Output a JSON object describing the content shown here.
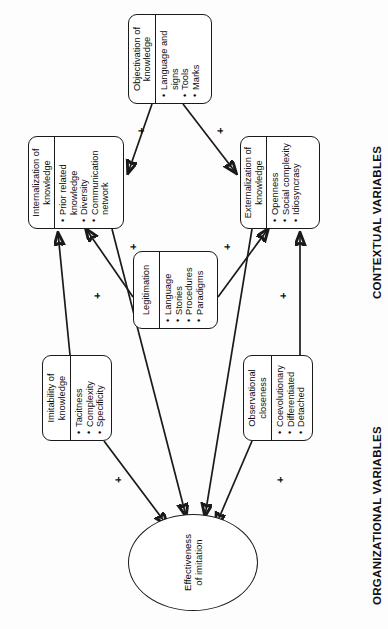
{
  "diagram": {
    "title_sections": {
      "contextual": "CONTEXTUAL VARIABLES",
      "organizational": "ORGANIZATIONAL VARIABLES"
    },
    "outcome": {
      "label": "Effectiveness\nof imitation",
      "line1": "Effectiveness",
      "line2": "of imitation"
    },
    "boxes": [
      {
        "id": "observational-closeness",
        "title": "Observational closeness",
        "items": [
          "Coevolutionary",
          "Differentiated",
          "Detached"
        ]
      },
      {
        "id": "imitability-of-knowledge",
        "title": "Imitability of knowledge",
        "items": [
          "Tacitness",
          "Complexity",
          "Specificity"
        ]
      },
      {
        "id": "legitimation",
        "title": "Legitimation",
        "items": [
          "Language",
          "Stories",
          "Procedures",
          "Paradigms"
        ]
      },
      {
        "id": "externalization-of-knowledge",
        "title": "Externalization of knowledge",
        "items": [
          "Openness",
          "Social complexity",
          "Idiosyncrasy"
        ]
      },
      {
        "id": "internalization-of-knowledge",
        "title": "Internalization of knowledge",
        "items": [
          "Prior related knowledge",
          "Diversity",
          "Communication network"
        ]
      },
      {
        "id": "objectivation-of-knowledge",
        "title": "Objectivation of knowledge",
        "items": [
          "Language and signs",
          "Tools",
          "Marks"
        ]
      }
    ],
    "signs": [
      {
        "id": "sign-observational-to-effectiveness",
        "value": "+"
      },
      {
        "id": "sign-imitability-to-effectiveness",
        "value": "+"
      },
      {
        "id": "sign-observational-to-externalization",
        "value": "+"
      },
      {
        "id": "sign-imitability-to-internalization",
        "value": "+"
      },
      {
        "id": "sign-legitimation-to-externalization",
        "value": "+"
      },
      {
        "id": "sign-legitimation-to-internalization",
        "value": "+"
      },
      {
        "id": "sign-objectivation-to-externalization",
        "value": "+"
      },
      {
        "id": "sign-objectivation-to-internalization",
        "value": "+"
      }
    ]
  }
}
